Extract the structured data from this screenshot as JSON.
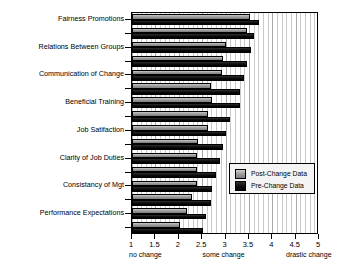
{
  "chart_data": {
    "type": "bar",
    "orientation": "horizontal",
    "title": "",
    "xlabel": "",
    "ylabel": "Survey Catagory",
    "xlim": [
      1,
      5
    ],
    "ylim_note": "categorical",
    "grid": true,
    "grid_axis": "x",
    "legend_position": "center-right-inside",
    "xticks": [
      1,
      1.5,
      2,
      2.5,
      3,
      3.5,
      4,
      4.5,
      5
    ],
    "xtick_labels": [
      "1",
      "1.5",
      "2",
      "2.5",
      "3",
      "3.5",
      "4",
      "4.5",
      "5"
    ],
    "x_anchor_labels": [
      {
        "value": 1,
        "text": "no change"
      },
      {
        "value": 3,
        "text": "some change"
      },
      {
        "value": 5,
        "text": "drastic change"
      }
    ],
    "categories": [
      "Fairness Promotions",
      "",
      "Relations Between Groups",
      "",
      "Communication of Change",
      "",
      "Beneficial Training",
      "",
      "Job Satifaction",
      "",
      "Clarity of Job Duties",
      "",
      "Consistancy of Mgt",
      "",
      "Performance Expectations",
      ""
    ],
    "labeled_categories": [
      "Fairness Promotions",
      "Relations Between Groups",
      "Communication of Change",
      "Beneficial Training",
      "Job Satifaction",
      "Clarity of Job Duties",
      "Consistancy of Mgt",
      "Performance Expectations"
    ],
    "series": [
      {
        "name": "Post-Change Data",
        "color": "#9b9b9b",
        "values": [
          3.52,
          3.45,
          3.0,
          2.95,
          2.92,
          2.7,
          2.72,
          2.62,
          2.62,
          2.42,
          2.4,
          2.4,
          2.38,
          2.28,
          2.18,
          2.02
        ]
      },
      {
        "name": "Pre-Change Data",
        "color": "#0c0c0c",
        "values": [
          3.72,
          3.62,
          3.55,
          3.45,
          3.4,
          3.32,
          3.3,
          3.1,
          3.02,
          2.95,
          2.88,
          2.8,
          2.72,
          2.68,
          2.58,
          2.52
        ]
      }
    ]
  },
  "legend": {
    "items": [
      {
        "label": "Post-Change Data",
        "swatch": "post"
      },
      {
        "label": "Pre-Change Data",
        "swatch": "pre"
      }
    ]
  }
}
